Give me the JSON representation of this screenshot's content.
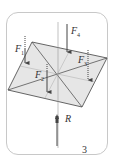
{
  "figure": {
    "number": "3",
    "labels": {
      "f1": {
        "base": "F",
        "sub": "1"
      },
      "f2": {
        "base": "F",
        "sub": "2"
      },
      "f3": {
        "base": "F",
        "sub": "3"
      },
      "f4": {
        "base": "F",
        "sub": "4"
      },
      "r": "R"
    },
    "colors": {
      "plate_fill": "#e6e6e6",
      "edges": "#555555",
      "arrows": "#444444",
      "frame": "#c8c8c8"
    }
  }
}
